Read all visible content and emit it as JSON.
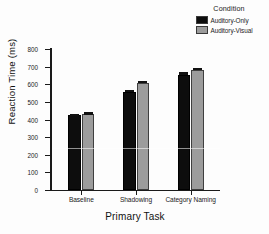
{
  "chart_data": {
    "type": "bar",
    "title": "",
    "xlabel": "Primary Task",
    "ylabel": "Reaction Time (ms)",
    "categories": [
      "Baseline",
      "Shadowing",
      "Category Naming"
    ],
    "series": [
      {
        "name": "Auditory-Only",
        "color": "#0d0d0d",
        "values": [
          423,
          557,
          655
        ],
        "errors": [
          5,
          5,
          6
        ]
      },
      {
        "name": "Auditory-Visual",
        "color": "#9c9c9c",
        "values": [
          431,
          608,
          681
        ],
        "errors": [
          5,
          5,
          5
        ]
      }
    ],
    "ylim": [
      0,
      800
    ],
    "yticks": [
      0,
      100,
      200,
      300,
      400,
      500,
      600,
      700,
      800
    ],
    "ytick_labels": [
      "0",
      "100",
      "200",
      "300",
      "400",
      "500",
      "600",
      "700",
      "800"
    ],
    "grid": false,
    "legend": {
      "title": "Condition",
      "position": "top-right",
      "entries": [
        {
          "label": "Auditory-Only",
          "color": "#0d0d0d"
        },
        {
          "label": "Auditory-Visual",
          "color": "#9c9c9c"
        }
      ]
    }
  }
}
